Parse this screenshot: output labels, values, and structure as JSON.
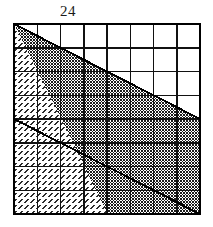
{
  "figure": {
    "type": "geometric-grid-diagram",
    "title_label": "24",
    "grid": {
      "columns": 8,
      "rows": 8,
      "origin_x": 14,
      "origin_y": 24,
      "width": 186,
      "height": 190,
      "cell_width": 23.25,
      "cell_height": 23.75,
      "border_color": "#000000",
      "border_width": 2.2,
      "line_color": "#111111",
      "line_width": 1.5
    },
    "diagonals": [
      {
        "name": "upper-diagonal",
        "from_cell": [
          0,
          0
        ],
        "to_cell": [
          8,
          4
        ],
        "note": "runs from top-left corner to right edge at row 4"
      },
      {
        "name": "lower-diagonal",
        "from_cell": [
          0,
          4
        ],
        "to_cell": [
          8,
          8
        ],
        "note": "runs from left edge at row 4 to bottom-right corner"
      }
    ],
    "regions": [
      {
        "name": "upper-white-triangle",
        "fill": "white",
        "color": "#ffffff",
        "position": "top-right"
      },
      {
        "name": "middle-dark-band",
        "fill": "dense-checker-stipple",
        "color": "#808080",
        "position": "center-diagonal-band"
      },
      {
        "name": "lower-light-triangle",
        "fill": "diagonal-hatch-dash",
        "color": "#d8d8d8",
        "position": "bottom-left"
      }
    ]
  }
}
